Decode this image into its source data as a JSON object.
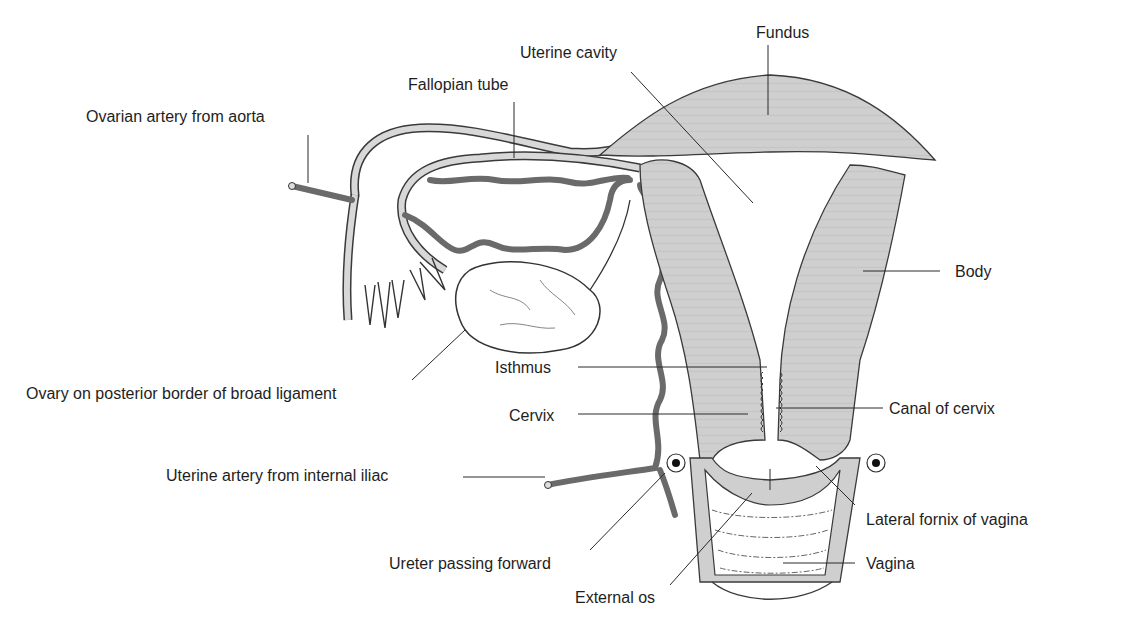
{
  "diagram": {
    "colors": {
      "muscle_fill": "#cfcfcf",
      "muscle_stroke": "#3a3a3a",
      "artery": "#6a6a6a",
      "leader_line": "#2a2a2a",
      "background": "#ffffff"
    },
    "labels": [
      {
        "id": "ovarian-artery",
        "text": "Ovarian artery from aorta",
        "x": 86,
        "y": 108
      },
      {
        "id": "fallopian-tube",
        "text": "Fallopian tube",
        "x": 408,
        "y": 76
      },
      {
        "id": "uterine-cavity",
        "text": "Uterine cavity",
        "x": 520,
        "y": 44
      },
      {
        "id": "fundus",
        "text": "Fundus",
        "x": 756,
        "y": 24
      },
      {
        "id": "body",
        "text": "Body",
        "x": 955,
        "y": 263
      },
      {
        "id": "ovary",
        "text": "Ovary on posterior border of broad ligament",
        "x": 26,
        "y": 385
      },
      {
        "id": "isthmus",
        "text": "Isthmus",
        "x": 495,
        "y": 359
      },
      {
        "id": "cervix",
        "text": "Cervix",
        "x": 509,
        "y": 407
      },
      {
        "id": "canal-of-cervix",
        "text": "Canal of cervix",
        "x": 889,
        "y": 400
      },
      {
        "id": "uterine-artery",
        "text": "Uterine artery from internal iliac",
        "x": 166,
        "y": 467
      },
      {
        "id": "lateral-fornix",
        "text": "Lateral fornix of vagina",
        "x": 866,
        "y": 511
      },
      {
        "id": "ureter",
        "text": "Ureter passing forward",
        "x": 389,
        "y": 555
      },
      {
        "id": "vagina",
        "text": "Vagina",
        "x": 866,
        "y": 555
      },
      {
        "id": "external-os",
        "text": "External os",
        "x": 575,
        "y": 589
      }
    ]
  }
}
